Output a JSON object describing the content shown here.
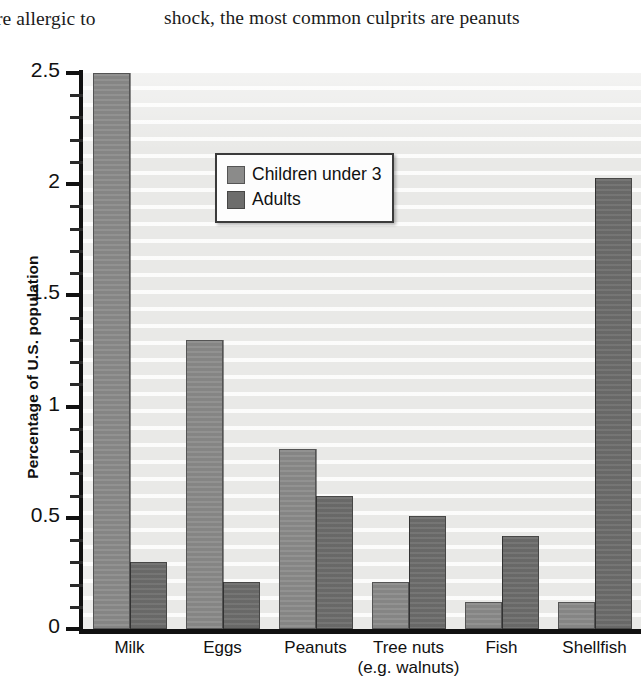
{
  "page": {
    "body_text_left": "re allergic to",
    "body_text_right": "shock, the most common culprits are peanuts"
  },
  "figure": {
    "y_axis_title": "Percentage of U.S. population",
    "legend": {
      "items": [
        {
          "label": "Children under 3",
          "color": "#8b8b8a",
          "swatch_name": "legend-swatch-children"
        },
        {
          "label": "Adults",
          "color": "#6d6d6c",
          "swatch_name": "legend-swatch-adults"
        }
      ]
    },
    "y_tick_labels": [
      "0",
      "0.5",
      "1",
      "1.5",
      "2",
      "2.5"
    ],
    "category_labels": [
      {
        "line1": "Milk",
        "line2": ""
      },
      {
        "line1": "Eggs",
        "line2": ""
      },
      {
        "line1": "Peanuts",
        "line2": ""
      },
      {
        "line1": "Tree nuts",
        "line2": "(e.g. walnuts)"
      },
      {
        "line1": "Fish",
        "line2": ""
      },
      {
        "line1": "Shellfish",
        "line2": ""
      }
    ],
    "plot_background": "#e9e9e7"
  },
  "chart_data": {
    "type": "bar",
    "title": "",
    "xlabel": "",
    "ylabel": "Percentage of U.S. population",
    "ylim": [
      0,
      2.5
    ],
    "ytick_step": 0.5,
    "yminor_step": 0.1,
    "grid": true,
    "legend_position": "upper center",
    "categories": [
      "Milk",
      "Eggs",
      "Peanuts",
      "Tree nuts (e.g. walnuts)",
      "Fish",
      "Shellfish"
    ],
    "series": [
      {
        "name": "Children under 3",
        "color": "#8b8b8a",
        "values": [
          2.5,
          1.3,
          0.81,
          0.21,
          0.12,
          0.12
        ]
      },
      {
        "name": "Adults",
        "color": "#6d6d6c",
        "values": [
          0.3,
          0.21,
          0.6,
          0.51,
          0.42,
          2.03
        ]
      }
    ]
  }
}
